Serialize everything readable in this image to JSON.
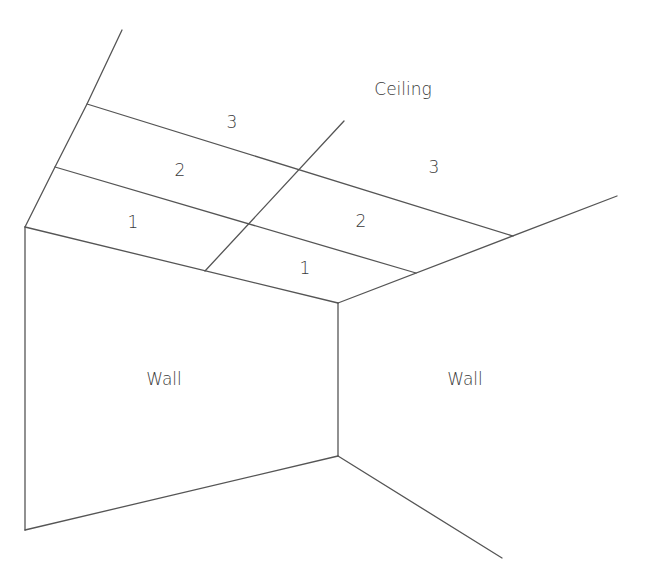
{
  "diagram": {
    "type": "room-corner-perspective",
    "labels": {
      "ceiling": "Ceiling",
      "wall_left": "Wall",
      "wall_right": "Wall"
    },
    "ceiling_panels": {
      "left_section": [
        "1",
        "2",
        "3"
      ],
      "right_section": [
        "1",
        "2",
        "3"
      ]
    },
    "line_color": "#555555",
    "text_color": "#3a3a3a"
  }
}
